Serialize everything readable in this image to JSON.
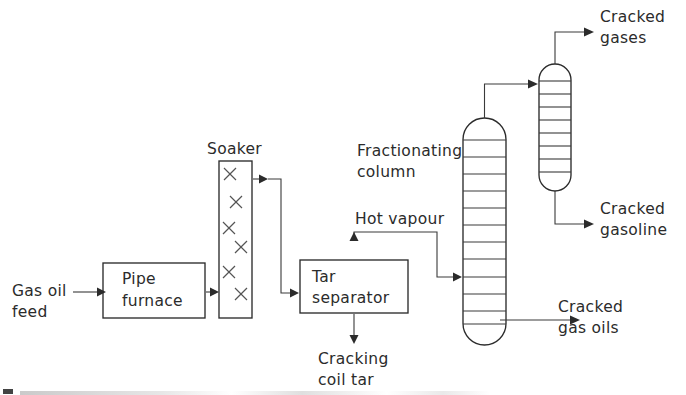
{
  "diagram": {
    "type": "process-flow-diagram",
    "canvas": {
      "width": 686,
      "height": 395
    },
    "palette": {
      "background": "#ffffff",
      "line": "#2b2b2b",
      "text": "#2b2b2b",
      "packing": "#555555"
    },
    "labels": {
      "gas_oil_feed_line1": "Gas oil",
      "gas_oil_feed_line2": "feed",
      "pipe_furnace_line1": "Pipe",
      "pipe_furnace_line2": "furnace",
      "soaker": "Soaker",
      "tar_separator_line1": "Tar",
      "tar_separator_line2": "separator",
      "cracking_coil_tar_line1": "Cracking",
      "cracking_coil_tar_line2": "coil tar",
      "hot_vapour": "Hot vapour",
      "fractionating_column_line1": "Fractionating",
      "fractionating_column_line2": "column",
      "cracked_gases_line1": "Cracked",
      "cracked_gases_line2": "gases",
      "cracked_gasoline_line1": "Cracked",
      "cracked_gasoline_line2": "gasoline",
      "cracked_gas_oils_line1": "Cracked",
      "cracked_gas_oils_line2": "gas oils"
    },
    "equipment": [
      {
        "id": "pipe-furnace",
        "name": "Pipe furnace",
        "shape": "rectangle",
        "x": 103,
        "y": 263,
        "width": 102,
        "height": 55
      },
      {
        "id": "soaker",
        "name": "Soaker",
        "shape": "tall-rectangle-with-packing",
        "x": 219,
        "y": 161,
        "width": 33,
        "height": 157,
        "packing_marks": 6,
        "packing_symbol": "x-cross"
      },
      {
        "id": "tar-separator",
        "name": "Tar separator",
        "shape": "rectangle",
        "x": 300,
        "y": 260,
        "width": 108,
        "height": 53
      },
      {
        "id": "fractionating-column",
        "name": "Fractionating column",
        "shape": "vertical-vessel-rounded-ends",
        "x": 463,
        "y": 118,
        "width": 43,
        "height": 227,
        "trays": 12
      },
      {
        "id": "secondary-column",
        "name": "Gas / gasoline column",
        "shape": "vertical-vessel-rounded-ends",
        "x": 539,
        "y": 64,
        "width": 32,
        "height": 127,
        "trays": 8
      }
    ],
    "streams": [
      {
        "id": "gas-oil-feed",
        "label": "Gas oil feed",
        "from": "feed",
        "to": "pipe-furnace"
      },
      {
        "id": "furnace-to-soaker",
        "label": "",
        "from": "pipe-furnace",
        "to": "soaker"
      },
      {
        "id": "soaker-to-tar",
        "label": "",
        "from": "soaker",
        "to": "tar-separator"
      },
      {
        "id": "hot-vapour",
        "label": "Hot vapour",
        "from": "tar-separator",
        "to": "fractionating-column"
      },
      {
        "id": "cracking-coil-tar",
        "label": "Cracking coil tar",
        "from": "tar-separator",
        "to": "product"
      },
      {
        "id": "overhead-to-col2",
        "label": "",
        "from": "fractionating-column",
        "to": "secondary-column"
      },
      {
        "id": "cracked-gas-oils",
        "label": "Cracked gas oils",
        "from": "fractionating-column",
        "to": "product"
      },
      {
        "id": "cracked-gases",
        "label": "Cracked gases",
        "from": "secondary-column",
        "to": "product"
      },
      {
        "id": "cracked-gasoline",
        "label": "Cracked gasoline",
        "from": "secondary-column",
        "to": "product"
      }
    ]
  }
}
